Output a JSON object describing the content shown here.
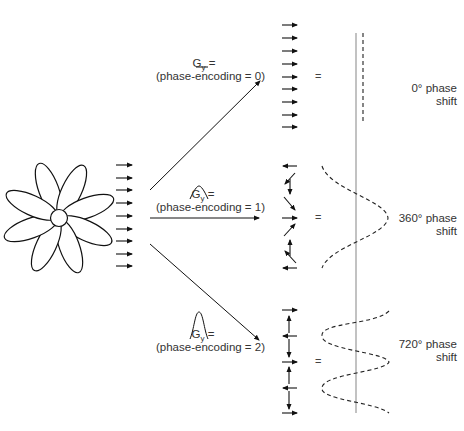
{
  "diagram": {
    "object_icon": "flower",
    "branches": [
      {
        "gradient_label": "G",
        "gradient_subscript": "y",
        "gradient_equals": " =",
        "gradient_shape": "flat",
        "encoding_label": "(phase-encoding = 0)",
        "equals_sign": "=",
        "result_line1": "0° phase",
        "result_line2": "shift"
      },
      {
        "gradient_label": "G",
        "gradient_subscript": "y",
        "gradient_equals": " =",
        "gradient_shape": "small-bump",
        "encoding_label": "(phase-encoding = 1)",
        "equals_sign": "=",
        "result_line1": "360° phase",
        "result_line2": "shift"
      },
      {
        "gradient_label": "G",
        "gradient_subscript": "y",
        "gradient_equals": " =",
        "gradient_shape": "tall-bump",
        "encoding_label": "(phase-encoding = 2)",
        "equals_sign": "=",
        "result_line1": "720° phase",
        "result_line2": "shift"
      }
    ]
  }
}
